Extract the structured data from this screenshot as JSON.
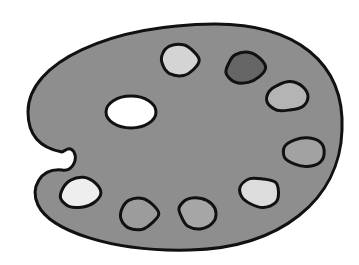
{
  "image": {
    "subject": "Artist paint palette",
    "description": "Grayscale illustration of a kidney-shaped artist's palette with a thumb hole and eight paint dabs",
    "colors": {
      "background": "#ffffff",
      "palette_fill": "#8e8e8e",
      "outline": "#111111",
      "thumb_hole": "#ffffff"
    },
    "thumb_hole": {
      "cx": 131,
      "cy": 112,
      "rx": 25,
      "ry": 16
    },
    "paint_dabs": [
      {
        "name": "dab-1",
        "cx": 180,
        "cy": 60,
        "shade": "#d4d4d4"
      },
      {
        "name": "dab-2",
        "cx": 245,
        "cy": 68,
        "shade": "#666666"
      },
      {
        "name": "dab-3",
        "cx": 287,
        "cy": 97,
        "shade": "#b4b4b4"
      },
      {
        "name": "dab-4",
        "cx": 304,
        "cy": 152,
        "shade": "#a2a2a2"
      },
      {
        "name": "dab-5",
        "cx": 260,
        "cy": 192,
        "shade": "#dcdcdc"
      },
      {
        "name": "dab-6",
        "cx": 198,
        "cy": 213,
        "shade": "#a6a6a6"
      },
      {
        "name": "dab-7",
        "cx": 139,
        "cy": 214,
        "shade": "#9c9c9c"
      },
      {
        "name": "dab-8",
        "cx": 80,
        "cy": 193,
        "shade": "#eeeeee"
      }
    ]
  }
}
